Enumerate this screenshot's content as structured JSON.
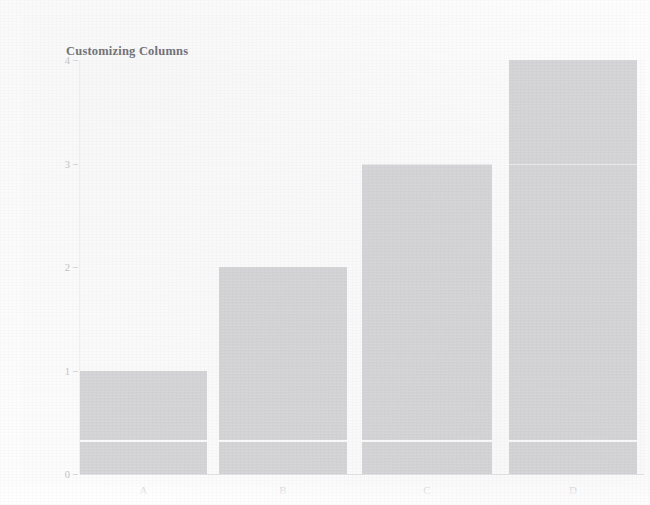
{
  "chart_data": {
    "type": "bar",
    "title": "Customizing Columns",
    "xlabel": "",
    "ylabel": "",
    "categories": [
      "A",
      "B",
      "C",
      "D"
    ],
    "values": [
      1,
      2,
      3,
      4
    ],
    "series": [
      {
        "name": "values",
        "values": [
          1,
          2,
          3,
          4
        ]
      }
    ],
    "ylim": [
      0,
      4
    ],
    "xlim": [
      0,
      4
    ],
    "y_ticks": [
      "0",
      "1",
      "2",
      "3",
      "4"
    ],
    "y_tick_values": [
      0,
      1,
      2,
      3,
      4
    ],
    "x_ticks": [
      "A",
      "B",
      "C",
      "D"
    ],
    "grid": true,
    "gridlines_y": [
      0.33,
      3
    ],
    "legend": null,
    "legend_position": "none",
    "bar_color": "#d6d6d8",
    "gridline_color": "#fbfbfb",
    "axis_color": "#e3e3e5",
    "title_color": "#6f6f73",
    "tick_label_color": "#c3c3c7",
    "background_color": "#fcfcfc",
    "annotations": []
  },
  "figure": {
    "title": "Customizing Columns"
  }
}
